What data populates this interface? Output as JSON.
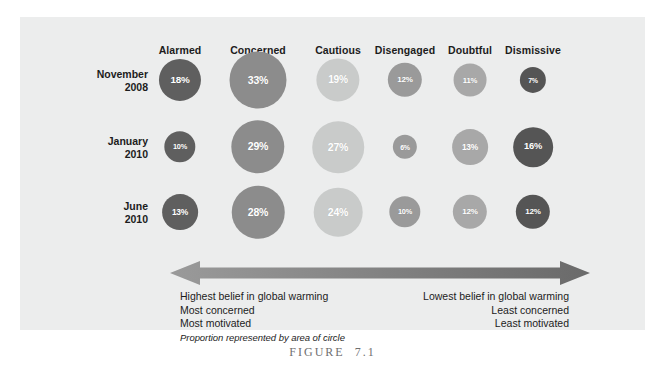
{
  "figure": {
    "caption_label": "FIGURE",
    "caption_number": "7.1",
    "panel_background": "#eceded"
  },
  "chart_data": {
    "type": "heatmap",
    "title": "",
    "xlabel": "",
    "ylabel": "",
    "categories": [
      "Alarmed",
      "Concerned",
      "Cautious",
      "Disengaged",
      "Doubtful",
      "Dismissive"
    ],
    "rows": [
      "November 2008",
      "January 2010",
      "June 2010"
    ],
    "row_lines": [
      [
        "November",
        "2008"
      ],
      [
        "January",
        "2010"
      ],
      [
        "June",
        "2010"
      ]
    ],
    "series": [
      {
        "name": "November 2008",
        "values": [
          18,
          33,
          19,
          12,
          11,
          7
        ]
      },
      {
        "name": "January 2010",
        "values": [
          10,
          29,
          27,
          6,
          13,
          16
        ]
      },
      {
        "name": "June 2010",
        "values": [
          13,
          28,
          24,
          10,
          12,
          12
        ]
      }
    ],
    "value_suffix": "%",
    "column_colors": [
      "#5f5f5f",
      "#8c8c8c",
      "#c9cbca",
      "#9a9a9a",
      "#a8a8a8",
      "#555555"
    ],
    "encoding": "area",
    "legend": "none",
    "grid": false
  },
  "annotations": {
    "arrow_name": "spectrum-arrow",
    "arrow_color_left": "#949494",
    "arrow_color_right": "#6d6d6d",
    "left": {
      "line1": "Highest belief in global warming",
      "line2": "Most concerned",
      "line3": "Most motivated",
      "note": "Proportion represented by area of circle"
    },
    "right": {
      "line1": "Lowest belief in global warming",
      "line2": "Least concerned",
      "line3": "Least motivated"
    }
  }
}
